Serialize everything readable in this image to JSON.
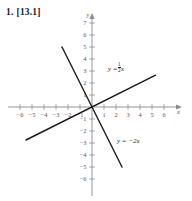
{
  "problem": {
    "number": "1.",
    "reference": "[13.1]"
  },
  "chart_data": {
    "type": "line",
    "title": "",
    "xlabel": "x",
    "ylabel": "y",
    "xlim": [
      -6.8,
      6.8
    ],
    "ylim": [
      -6.8,
      7.4
    ],
    "grid": false,
    "legend": "inline-annotations",
    "xticks": [
      -6,
      -5,
      -4,
      -3,
      -2,
      -1,
      1,
      2,
      3,
      4,
      5,
      6
    ],
    "yticks": [
      -6,
      -5,
      -4,
      -3,
      -2,
      -1,
      1,
      2,
      3,
      4,
      5,
      6,
      7
    ],
    "xtick_labels": [
      "-6",
      "-5",
      "-4",
      "-3",
      "-2",
      "-1",
      "1",
      "2",
      "3",
      "4",
      "5",
      "6"
    ],
    "ytick_labels": [
      "-6",
      "-5",
      "-4",
      "-3",
      "-2",
      "-1",
      "1",
      "2",
      "3",
      "4",
      "5",
      "6",
      "7"
    ],
    "series": [
      {
        "name": "y = 1/2 x",
        "label_text_lhs": "y =",
        "label_numerator": "1",
        "label_denominator": "2",
        "label_variable": "x",
        "slope": 0.5,
        "intercept": 0,
        "x": [
          -5.5,
          5.3
        ],
        "y": [
          -2.75,
          2.65
        ],
        "color": "#1a1a1a"
      },
      {
        "name": "y = -2x",
        "label_text": "y = −2x",
        "slope": -2,
        "intercept": 0,
        "x": [
          -2.5,
          2.5
        ],
        "y": [
          5.0,
          -5.0
        ],
        "color": "#1a1a1a"
      }
    ],
    "axis_color": "#8a8a93",
    "line_color": "#1a1a1a",
    "tick_label_color": "#55555c"
  }
}
